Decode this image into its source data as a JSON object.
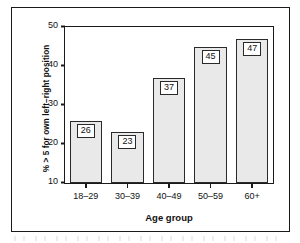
{
  "figure": {
    "has_outer_frame": true
  },
  "chart_data": {
    "type": "bar",
    "title": "",
    "xlabel": "Age group",
    "ylabel": "% > 5 for own left–right position",
    "categories": [
      "18–29",
      "30–39",
      "40–49",
      "50–59",
      "60+"
    ],
    "values": [
      26,
      23,
      37,
      45,
      47
    ],
    "value_labels": [
      "26",
      "23",
      "37",
      "45",
      "47"
    ],
    "ylim": [
      10,
      50
    ],
    "yticks": [
      10,
      20,
      30,
      40,
      50
    ],
    "ytick_labels": [
      "10",
      "20",
      "30",
      "40",
      "50"
    ],
    "grid": false,
    "legend": false,
    "legend_position": "none",
    "bar_fill_color": "#e9e9e9",
    "bar_edge_color": "#2a2a2a",
    "axis_color": "#1a1a1a",
    "label_box_fill": "#ffffff",
    "label_box_border": "#2a2a2a"
  }
}
